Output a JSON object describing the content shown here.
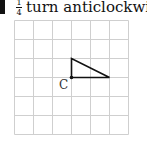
{
  "question": {
    "number_marker": "",
    "fraction": {
      "numerator": "1",
      "denominator": "4"
    },
    "instruction": "turn anticlockwise a"
  },
  "grid": {
    "columns": 6,
    "rows": 6,
    "cell_size_px": 19,
    "line_color": "#cccccc"
  },
  "shape": {
    "type": "right-triangle",
    "vertices_grid": [
      [
        3,
        3
      ],
      [
        3,
        2
      ],
      [
        5,
        3
      ]
    ],
    "stroke_color": "#111111"
  },
  "center_label": "C"
}
